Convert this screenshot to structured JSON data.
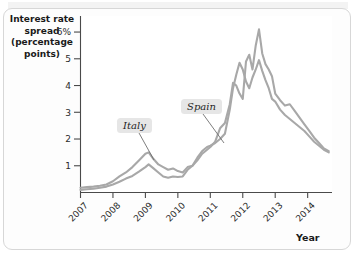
{
  "figure": {
    "background_color": "#ffffff",
    "border_color": "#d7d7d7"
  },
  "axes": {
    "ylabel_lines": [
      "Interest rate",
      "spread",
      "(percentage",
      "points)"
    ],
    "xlabel": "Year"
  },
  "callouts": [
    {
      "name": "Italy",
      "label": "Italy"
    },
    {
      "name": "Spain",
      "label": "Spain"
    }
  ],
  "chart_data": {
    "type": "line",
    "title": "",
    "xlabel": "Year",
    "ylabel": "Interest rate spread (percentage points)",
    "xlim": [
      2007,
      2014.75
    ],
    "ylim": [
      0,
      6.6
    ],
    "xtick_labels": [
      "2007",
      "2008",
      "2009",
      "2010",
      "2011",
      "2012",
      "2013",
      "2014"
    ],
    "xticks": [
      2007,
      2008,
      2009,
      2010,
      2011,
      2012,
      2013,
      2014
    ],
    "ytick_labels": [
      "1",
      "2",
      "3",
      "4",
      "5",
      "6%"
    ],
    "yticks": [
      1,
      2,
      3,
      4,
      5,
      6
    ],
    "grid": false,
    "legend": "annotated-callouts",
    "line_color": "#a8a8a8",
    "series": [
      {
        "name": "Italy",
        "color": "#a8a8a8",
        "x": [
          2007.0,
          2007.2,
          2007.4,
          2007.6,
          2007.8,
          2008.0,
          2008.2,
          2008.4,
          2008.6,
          2008.8,
          2009.0,
          2009.1,
          2009.25,
          2009.4,
          2009.55,
          2009.7,
          2009.85,
          2010.0,
          2010.15,
          2010.3,
          2010.45,
          2010.6,
          2010.75,
          2010.9,
          2011.0,
          2011.15,
          2011.3,
          2011.45,
          2011.6,
          2011.7,
          2011.8,
          2011.9,
          2012.0,
          2012.1,
          2012.2,
          2012.3,
          2012.4,
          2012.5,
          2012.6,
          2012.7,
          2012.8,
          2012.9,
          2013.0,
          2013.15,
          2013.3,
          2013.45,
          2013.6,
          2013.75,
          2013.9,
          2014.05,
          2014.2,
          2014.35,
          2014.5,
          2014.65
        ],
        "y": [
          0.18,
          0.2,
          0.22,
          0.25,
          0.3,
          0.42,
          0.6,
          0.75,
          0.95,
          1.2,
          1.45,
          1.5,
          1.25,
          1.05,
          0.95,
          0.85,
          0.9,
          0.8,
          0.75,
          0.95,
          1.0,
          1.3,
          1.55,
          1.7,
          1.75,
          1.85,
          2.0,
          2.2,
          3.1,
          3.9,
          4.4,
          4.85,
          4.6,
          4.15,
          3.9,
          4.3,
          4.6,
          4.95,
          4.55,
          4.2,
          3.9,
          3.5,
          3.4,
          3.1,
          2.9,
          2.75,
          2.6,
          2.45,
          2.3,
          2.1,
          1.9,
          1.75,
          1.6,
          1.5
        ]
      },
      {
        "name": "Spain",
        "color": "#a8a8a8",
        "x": [
          2007.0,
          2007.2,
          2007.4,
          2007.6,
          2007.8,
          2008.0,
          2008.2,
          2008.4,
          2008.6,
          2008.8,
          2009.0,
          2009.1,
          2009.25,
          2009.4,
          2009.55,
          2009.7,
          2009.85,
          2010.0,
          2010.15,
          2010.3,
          2010.45,
          2010.6,
          2010.75,
          2010.9,
          2011.0,
          2011.15,
          2011.3,
          2011.45,
          2011.6,
          2011.7,
          2011.8,
          2011.9,
          2012.0,
          2012.1,
          2012.2,
          2012.3,
          2012.4,
          2012.5,
          2012.6,
          2012.7,
          2012.8,
          2012.9,
          2013.0,
          2013.15,
          2013.3,
          2013.45,
          2013.6,
          2013.75,
          2013.9,
          2014.05,
          2014.2,
          2014.35,
          2014.5,
          2014.65
        ],
        "y": [
          0.1,
          0.12,
          0.14,
          0.18,
          0.22,
          0.3,
          0.4,
          0.52,
          0.62,
          0.78,
          0.95,
          1.05,
          0.9,
          0.75,
          0.6,
          0.55,
          0.6,
          0.58,
          0.6,
          0.85,
          1.0,
          1.2,
          1.45,
          1.6,
          1.7,
          1.9,
          2.4,
          2.6,
          3.3,
          4.1,
          4.0,
          3.7,
          3.5,
          4.9,
          5.15,
          4.6,
          5.5,
          6.1,
          5.2,
          4.8,
          4.6,
          4.35,
          3.7,
          3.45,
          3.25,
          3.3,
          3.05,
          2.8,
          2.55,
          2.3,
          2.05,
          1.85,
          1.65,
          1.55
        ]
      }
    ]
  }
}
